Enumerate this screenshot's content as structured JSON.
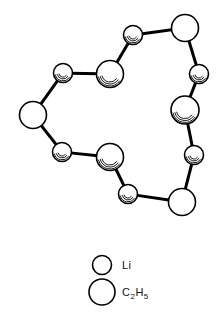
{
  "figure": {
    "type": "molecular-structure-diagram",
    "background_color": "#ffffff",
    "stroke_color": "#000000",
    "fill_color": "#ffffff",
    "bond_width": 3,
    "atom_outline_width": 1.6,
    "atoms": [
      {
        "id": "li-top",
        "label": "Li",
        "species": "Li",
        "size": "small",
        "cx": 133,
        "cy": 35,
        "r": 9.5,
        "shaded": true
      },
      {
        "id": "et-top-right",
        "label": "C2H5",
        "species": "C2H5",
        "size": "large",
        "cx": 185,
        "cy": 28,
        "r": 13.5,
        "shaded": false
      },
      {
        "id": "li-upper-right",
        "label": "Li",
        "species": "Li",
        "size": "small",
        "cx": 199,
        "cy": 74,
        "r": 9.5,
        "shaded": true
      },
      {
        "id": "et-right",
        "label": "C2H5",
        "species": "C2H5",
        "size": "large",
        "cx": 185,
        "cy": 110,
        "r": 14,
        "shaded": true
      },
      {
        "id": "li-lower-right",
        "label": "Li",
        "species": "Li",
        "size": "small",
        "cx": 194,
        "cy": 155,
        "r": 9.5,
        "shaded": true
      },
      {
        "id": "et-bottom-right",
        "label": "C2H5",
        "species": "C2H5",
        "size": "large",
        "cx": 182,
        "cy": 202,
        "r": 13.5,
        "shaded": false
      },
      {
        "id": "li-bottom",
        "label": "Li",
        "species": "Li",
        "size": "small",
        "cx": 128,
        "cy": 194,
        "r": 9.5,
        "shaded": true
      },
      {
        "id": "et-bottom-center",
        "label": "C2H5",
        "species": "C2H5",
        "size": "large",
        "cx": 110,
        "cy": 157,
        "r": 13.5,
        "shaded": true
      },
      {
        "id": "li-lower-left",
        "label": "Li",
        "species": "Li",
        "size": "small",
        "cx": 62,
        "cy": 152,
        "r": 9.5,
        "shaded": true
      },
      {
        "id": "et-left",
        "label": "C2H5",
        "species": "C2H5",
        "size": "large",
        "cx": 33,
        "cy": 115,
        "r": 13.5,
        "shaded": false
      },
      {
        "id": "li-upper-left",
        "label": "Li",
        "species": "Li",
        "size": "small",
        "cx": 63,
        "cy": 73,
        "r": 9.5,
        "shaded": true
      },
      {
        "id": "et-upper-center",
        "label": "C2H5",
        "species": "C2H5",
        "size": "large",
        "cx": 110,
        "cy": 74,
        "r": 13.5,
        "shaded": true
      }
    ],
    "bonds": [
      {
        "from": "li-top",
        "to": "et-top-right"
      },
      {
        "from": "et-top-right",
        "to": "li-upper-right"
      },
      {
        "from": "li-upper-right",
        "to": "et-right"
      },
      {
        "from": "et-right",
        "to": "li-lower-right"
      },
      {
        "from": "li-lower-right",
        "to": "et-bottom-right"
      },
      {
        "from": "et-bottom-right",
        "to": "li-bottom"
      },
      {
        "from": "li-bottom",
        "to": "et-bottom-center"
      },
      {
        "from": "et-bottom-center",
        "to": "li-lower-left"
      },
      {
        "from": "li-lower-left",
        "to": "et-left"
      },
      {
        "from": "et-left",
        "to": "li-upper-left"
      },
      {
        "from": "li-upper-left",
        "to": "et-upper-center"
      },
      {
        "from": "et-upper-center",
        "to": "li-top"
      }
    ]
  },
  "legend": {
    "items": [
      {
        "id": "legend-li",
        "label": "Li",
        "label_main": "Li",
        "circle_cx": 102,
        "circle_cy": 265,
        "circle_r": 9.5,
        "text_x": 122,
        "text_y": 269
      },
      {
        "id": "legend-ethyl",
        "label": "C2H5",
        "label_main_a": "C",
        "label_sub_a": "2",
        "label_main_b": "H",
        "label_sub_b": "5",
        "circle_cx": 102,
        "circle_cy": 292,
        "circle_r": 13,
        "text_x": 122,
        "text_y": 296
      }
    ]
  }
}
